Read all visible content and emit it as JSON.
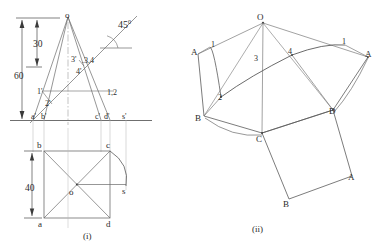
{
  "figure": {
    "type": "engineering-drawing",
    "panels": [
      {
        "id": "i",
        "caption": "(i)",
        "caption_x": 83,
        "caption_y": 232
      },
      {
        "id": "ii",
        "caption": "(ii)",
        "caption_x": 252,
        "caption_y": 225
      }
    ]
  },
  "panel_i": {
    "name": "front-view-and-top-view",
    "dimensions": [
      {
        "name": "height-30",
        "value": "30",
        "x": 33,
        "y": 40
      },
      {
        "name": "height-60",
        "value": "60",
        "x": 14,
        "y": 72
      },
      {
        "name": "width-40",
        "value": "40",
        "x": 25,
        "y": 184
      }
    ],
    "angle": {
      "name": "angle-45-degrees",
      "value": "45",
      "unit": "0",
      "x": 118,
      "y": 19
    },
    "front_view_labels": [
      {
        "name": "apex-o-front",
        "text": "o",
        "x": 65,
        "y": 11
      },
      {
        "name": "point-3prime",
        "text": "3'",
        "x": 71,
        "y": 56
      },
      {
        "name": "point-3-4",
        "text": ".3,4",
        "x": 82,
        "y": 57
      },
      {
        "name": "point-4prime",
        "text": "4'",
        "x": 76,
        "y": 68
      },
      {
        "name": "point-1prime",
        "text": "1'",
        "x": 37,
        "y": 88
      },
      {
        "name": "point-2prime",
        "text": "2'",
        "x": 45,
        "y": 100
      },
      {
        "name": "point-1-2",
        "text": "1,2",
        "x": 107,
        "y": 89
      },
      {
        "name": "point-aprime",
        "text": "a'",
        "x": 31,
        "y": 113
      },
      {
        "name": "point-bprime",
        "text": "b'",
        "x": 41,
        "y": 113
      },
      {
        "name": "point-cprime",
        "text": "c'",
        "x": 95,
        "y": 113
      },
      {
        "name": "point-dprime",
        "text": "d'",
        "x": 104,
        "y": 113
      },
      {
        "name": "point-sprime",
        "text": "s'",
        "x": 122,
        "y": 113
      }
    ],
    "top_view_labels": [
      {
        "name": "corner-b-top",
        "text": "b",
        "x": 37,
        "y": 141
      },
      {
        "name": "corner-c-top",
        "text": "c",
        "x": 106,
        "y": 141
      },
      {
        "name": "center-o-top",
        "text": "o",
        "x": 69,
        "y": 188
      },
      {
        "name": "point-s-top",
        "text": "s",
        "x": 122,
        "y": 187
      },
      {
        "name": "corner-a-top",
        "text": "a",
        "x": 38,
        "y": 220
      },
      {
        "name": "corner-d-top",
        "text": "d",
        "x": 106,
        "y": 220
      }
    ]
  },
  "panel_ii": {
    "name": "development-of-lateral-surface",
    "labels": [
      {
        "name": "apex-O-dev",
        "text": "O",
        "x": 257,
        "y": 15
      },
      {
        "name": "gen-line-1-left",
        "text": "1",
        "x": 211,
        "y": 41
      },
      {
        "name": "gen-line-1-right",
        "text": "1",
        "x": 342,
        "y": 38
      },
      {
        "name": "gen-line-3",
        "text": "3",
        "x": 254,
        "y": 55
      },
      {
        "name": "gen-line-4",
        "text": "4",
        "x": 288,
        "y": 48
      },
      {
        "name": "gen-line-2",
        "text": "2",
        "x": 218,
        "y": 94
      },
      {
        "name": "corner-A-left",
        "text": "A",
        "x": 191,
        "y": 49
      },
      {
        "name": "corner-A-right",
        "text": "A",
        "x": 365,
        "y": 51
      },
      {
        "name": "corner-B-left",
        "text": "B",
        "x": 195,
        "y": 115
      },
      {
        "name": "corner-D",
        "text": "D",
        "x": 329,
        "y": 108
      },
      {
        "name": "corner-C",
        "text": "C",
        "x": 256,
        "y": 136
      },
      {
        "name": "base-corner-A",
        "text": "A",
        "x": 348,
        "y": 174
      },
      {
        "name": "base-corner-B",
        "text": "B",
        "x": 283,
        "y": 201
      }
    ]
  },
  "colors": {
    "line": "#4a4a4a",
    "line_light": "#8a8a8a",
    "text": "#2b2b2b",
    "background": "#ffffff"
  }
}
